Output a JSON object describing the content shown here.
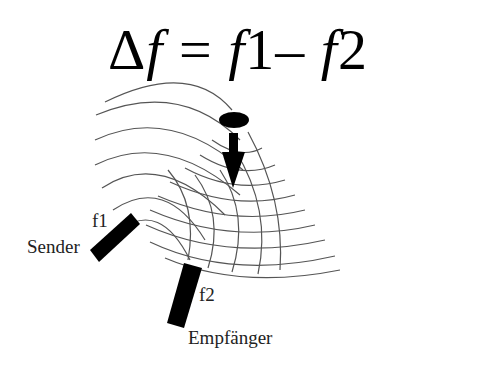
{
  "diagram": {
    "formula": {
      "delta": "Δ",
      "f_left": "f",
      "equals": " = ",
      "f1_var": "f",
      "f1_num": "1",
      "minus": "– ",
      "f2_var": "f",
      "f2_num": "2"
    },
    "labels": {
      "sender": "Sender",
      "f1": "f1",
      "f2": "f2",
      "receiver": "Empfänger"
    },
    "elements": {
      "emitter_name": "Sender",
      "receiver_name": "Empfänger",
      "moving_object": "ellipse with downward arrow",
      "wave_pattern": "concentric wave arcs from sender crossing reflected arcs"
    },
    "colors": {
      "background": "#ffffff",
      "ink": "#000000",
      "wave": "#555555"
    }
  }
}
